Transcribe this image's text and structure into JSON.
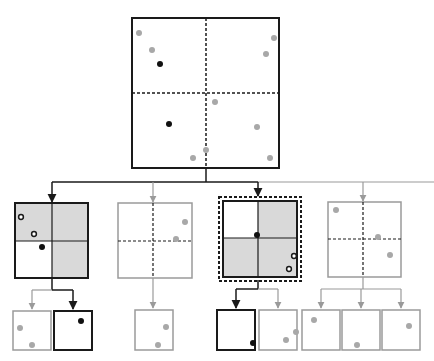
{
  "diagram": {
    "title": "",
    "type": "quadtree-partition",
    "colors": {
      "dark": "#1a1a1a",
      "light": "#9a9a9a",
      "shade": "#d9d9d9",
      "point_dark": "#111111",
      "point_light": "#a8a8a8",
      "background": "#ffffff"
    },
    "root": {
      "box": [
        132,
        18,
        279,
        168
      ],
      "mid": [
        206,
        93
      ],
      "points_light": [
        [
          139,
          33
        ],
        [
          152,
          50
        ],
        [
          274,
          38
        ],
        [
          266,
          54
        ],
        [
          215,
          102
        ],
        [
          257,
          127
        ],
        [
          206,
          150
        ],
        [
          193,
          158
        ],
        [
          270,
          158
        ]
      ],
      "points_dark": [
        [
          160,
          64
        ],
        [
          169,
          124
        ]
      ]
    },
    "children": [
      {
        "name": "child-1",
        "box": [
          15,
          203,
          88,
          278
        ],
        "mid": [
          52,
          241
        ],
        "active": true,
        "shaded": [
          "tl",
          "tr",
          "br"
        ],
        "points_open": [
          [
            21,
            217
          ],
          [
            34,
            234
          ]
        ],
        "points_dark": [
          [
            42,
            247
          ]
        ],
        "points_light": []
      },
      {
        "name": "child-2",
        "box": [
          118,
          203,
          192,
          278
        ],
        "mid": [
          153,
          241
        ],
        "active": false,
        "shaded": [],
        "points_open": [],
        "points_dark": [],
        "points_light": [
          [
            185,
            222
          ],
          [
            176,
            239
          ]
        ]
      },
      {
        "name": "child-3",
        "box": [
          223,
          201,
          297,
          277
        ],
        "mid": [
          258,
          238
        ],
        "active": true,
        "highlighted": true,
        "shaded": [
          "tr",
          "bl",
          "br"
        ],
        "points_open": [
          [
            294,
            256
          ],
          [
            289,
            269
          ]
        ],
        "points_dark": [
          [
            257,
            235
          ]
        ],
        "points_light": []
      },
      {
        "name": "child-4",
        "box": [
          328,
          202,
          401,
          277
        ],
        "mid": [
          363,
          239
        ],
        "active": false,
        "shaded": [],
        "points_open": [],
        "points_dark": [],
        "points_light": [
          [
            336,
            210
          ],
          [
            378,
            237
          ],
          [
            390,
            255
          ]
        ]
      }
    ],
    "leaves": [
      {
        "name": "leaf-a",
        "box": [
          13,
          311,
          51,
          350
        ],
        "active": false,
        "points_light": [
          [
            20,
            328
          ],
          [
            32,
            345
          ]
        ],
        "points_dark": []
      },
      {
        "name": "leaf-b",
        "box": [
          54,
          311,
          92,
          350
        ],
        "active": true,
        "points_light": [],
        "points_dark": [
          [
            81,
            321
          ]
        ]
      },
      {
        "name": "leaf-c",
        "box": [
          135,
          310,
          173,
          350
        ],
        "active": false,
        "points_light": [
          [
            166,
            327
          ],
          [
            158,
            345
          ]
        ],
        "points_dark": []
      },
      {
        "name": "leaf-d",
        "box": [
          217,
          310,
          255,
          350
        ],
        "active": true,
        "points_light": [],
        "points_dark": [
          [
            253,
            343
          ]
        ]
      },
      {
        "name": "leaf-e",
        "box": [
          259,
          310,
          297,
          350
        ],
        "active": false,
        "points_light": [
          [
            296,
            332
          ],
          [
            286,
            340
          ]
        ],
        "points_dark": []
      },
      {
        "name": "leaf-f",
        "box": [
          302,
          310,
          340,
          350
        ],
        "active": false,
        "points_light": [
          [
            314,
            320
          ]
        ],
        "points_dark": []
      },
      {
        "name": "leaf-g",
        "box": [
          342,
          310,
          380,
          350
        ],
        "active": false,
        "points_light": [
          [
            357,
            345
          ]
        ],
        "points_dark": []
      },
      {
        "name": "leaf-h",
        "box": [
          382,
          310,
          420,
          350
        ],
        "active": false,
        "points_light": [
          [
            409,
            326
          ]
        ],
        "points_dark": []
      }
    ]
  }
}
